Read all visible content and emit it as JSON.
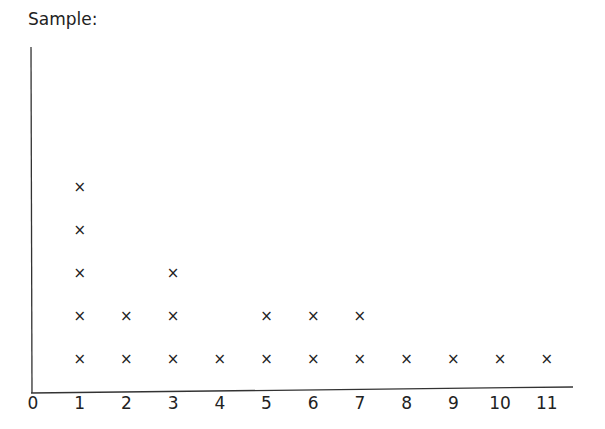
{
  "title": "Sample:",
  "chart_data": {
    "type": "dot-plot",
    "title": "Sample:",
    "xlabel": "",
    "ylabel": "",
    "marker": "x",
    "categories": [
      0,
      1,
      2,
      3,
      4,
      5,
      6,
      7,
      8,
      9,
      10,
      11
    ],
    "tick_labels": [
      "0",
      "1",
      "2",
      "3",
      "4",
      "5",
      "6",
      "7",
      "8",
      "9",
      "10",
      "11"
    ],
    "values": [
      0,
      5,
      2,
      3,
      1,
      2,
      2,
      2,
      1,
      1,
      1,
      1
    ],
    "xlim": [
      0,
      11
    ],
    "grid": false,
    "legend": null
  }
}
